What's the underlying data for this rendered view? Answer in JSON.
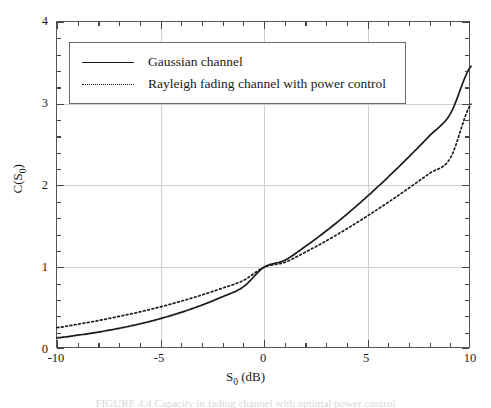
{
  "figure": {
    "caption": "FIGURE 4.4  Capacity in fading channel with optimal power control"
  },
  "axes": {
    "x": {
      "label_main": "S",
      "label_sub": "0",
      "label_unit": " (dB)",
      "label_full": "S0 (dB)",
      "min": -10,
      "max": 10,
      "major_ticks": [
        -10,
        -5,
        0,
        5,
        10
      ],
      "major_tick_labels": [
        "-10",
        "-5",
        "0",
        "5",
        "10"
      ],
      "minor_tick_step": 1
    },
    "y": {
      "label_main": "C(S",
      "label_sub": "0",
      "label_close": ")",
      "label_full": "C(S0)",
      "min": 0,
      "max": 4,
      "major_ticks": [
        0,
        1,
        2,
        3,
        4
      ],
      "major_tick_labels": [
        "0",
        "1",
        "2",
        "3",
        "4"
      ],
      "minor_tick_step": 0.2
    },
    "grid": "major-only",
    "grid_color": "#cfcfcf",
    "frame_color": "#555555"
  },
  "legend": {
    "position": "top-left-inside",
    "border_color": "#6a6a6a",
    "entries": [
      {
        "label": "Gaussian channel",
        "style": "solid",
        "color": "#1a1a1a"
      },
      {
        "label": "Rayleigh fading channel with power control",
        "style": "dotted",
        "color": "#1a1a1a"
      }
    ]
  },
  "chart_data": {
    "type": "line",
    "title": "",
    "xlabel": "S0 (dB)",
    "ylabel": "C(S0)",
    "xlim": [
      -10,
      10
    ],
    "ylim": [
      0,
      4
    ],
    "grid": true,
    "legend_position": "upper left",
    "x": [
      -10,
      -9,
      -8,
      -7,
      -6,
      -5,
      -4,
      -3,
      -2,
      -1,
      0,
      1,
      2,
      3,
      4,
      5,
      6,
      7,
      8,
      9,
      10
    ],
    "series": [
      {
        "name": "Gaussian channel",
        "style": "solid",
        "color": "#1a1a1a",
        "values": [
          0.137,
          0.169,
          0.207,
          0.253,
          0.307,
          0.372,
          0.448,
          0.537,
          0.64,
          0.76,
          1.0,
          1.085,
          1.255,
          1.443,
          1.648,
          1.869,
          2.104,
          2.351,
          2.609,
          2.876,
          3.459
        ]
      },
      {
        "name": "Rayleigh fading channel with power control",
        "style": "dotted",
        "color": "#1a1a1a",
        "values": [
          0.262,
          0.303,
          0.348,
          0.399,
          0.454,
          0.516,
          0.585,
          0.661,
          0.745,
          0.838,
          1.0,
          1.06,
          1.185,
          1.322,
          1.47,
          1.628,
          1.795,
          1.969,
          2.149,
          2.334,
          2.995
        ]
      }
    ],
    "annotations": [
      {
        "text": "curves intersect near S0 = 0 dB, C = 1.0",
        "x": 0,
        "y": 1.0
      }
    ]
  }
}
